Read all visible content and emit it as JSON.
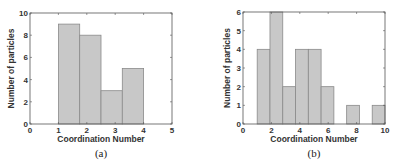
{
  "chart_data": [
    {
      "type": "bar",
      "subtype": "histogram",
      "panel_label": "(a)",
      "title": "",
      "xlabel": "Coordination Number",
      "ylabel": "Number of particles",
      "xlim": [
        0,
        5
      ],
      "ylim": [
        0,
        10
      ],
      "xticks": [
        "0",
        "1",
        "2",
        "3",
        "4",
        "5"
      ],
      "yticks": [
        "0",
        "2",
        "4",
        "6",
        "8",
        "10"
      ],
      "grid": false,
      "bins": [
        [
          1.0,
          1.75
        ],
        [
          1.75,
          2.5
        ],
        [
          2.5,
          3.25
        ],
        [
          3.25,
          4.0
        ]
      ],
      "values": [
        9,
        8,
        3,
        5
      ],
      "bar_color": "#c8c8c8",
      "edge_color": "#8a8a8a"
    },
    {
      "type": "bar",
      "subtype": "histogram",
      "panel_label": "(b)",
      "title": "",
      "xlabel": "Coordination Number",
      "ylabel": "Number of particles",
      "xlim": [
        0,
        10
      ],
      "ylim": [
        0,
        6
      ],
      "xticks": [
        "0",
        "2",
        "4",
        "6",
        "8",
        "10"
      ],
      "yticks": [
        "0",
        "1",
        "2",
        "3",
        "4",
        "5",
        "6"
      ],
      "grid": false,
      "bins": [
        [
          1.0,
          1.9
        ],
        [
          1.9,
          2.8
        ],
        [
          2.8,
          3.7
        ],
        [
          3.7,
          4.6
        ],
        [
          4.6,
          5.5
        ],
        [
          5.5,
          6.4
        ],
        [
          6.4,
          7.3
        ],
        [
          7.3,
          8.2
        ],
        [
          8.2,
          9.1
        ],
        [
          9.1,
          10.0
        ]
      ],
      "values": [
        4,
        6,
        2,
        4,
        4,
        2,
        0,
        1,
        0,
        1
      ],
      "bar_color": "#c8c8c8",
      "edge_color": "#8a8a8a"
    }
  ]
}
